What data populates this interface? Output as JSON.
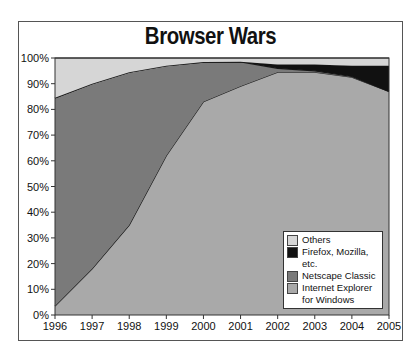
{
  "chart_data": {
    "type": "area",
    "stacked": true,
    "title": "Browser Wars",
    "xlabel": "",
    "ylabel": "",
    "x": [
      1996,
      1997,
      1998,
      1999,
      2000,
      2001,
      2002,
      2003,
      2004,
      2005
    ],
    "yticks": [
      "0%",
      "10%",
      "20%",
      "30%",
      "40%",
      "50%",
      "60%",
      "70%",
      "80%",
      "90%",
      "100%"
    ],
    "ylim": [
      0,
      100
    ],
    "grid": false,
    "legend_position": "lower right inside",
    "series": [
      {
        "name": "Internet Explorer for Windows",
        "color": "#a9a9a9",
        "values": [
          3.5,
          18,
          35,
          62,
          83,
          89,
          94.5,
          94.5,
          92.5,
          87
        ]
      },
      {
        "name": "Netscape Classic",
        "color": "#7a7a7a",
        "values": [
          81,
          72,
          59.5,
          35,
          15.4,
          9.5,
          1.5,
          0.5,
          0.3,
          0
        ]
      },
      {
        "name": "Firefox, Mozilla, etc.",
        "color": "#111111",
        "values": [
          0,
          0,
          0,
          0,
          0,
          0,
          1.5,
          2.5,
          4.2,
          10
        ]
      },
      {
        "name": "Others",
        "color": "#d6d6d6",
        "values": [
          15.5,
          10,
          5.5,
          3,
          1.6,
          1.5,
          2.5,
          2.5,
          3,
          3
        ]
      }
    ]
  },
  "legend": {
    "items": [
      {
        "label": "Others",
        "color": "#d6d6d6"
      },
      {
        "label": "Firefox, Mozilla, etc.",
        "color": "#111111"
      },
      {
        "label": "Netscape Classic",
        "color": "#7a7a7a"
      },
      {
        "label": "Internet Explorer for Windows",
        "color": "#a9a9a9"
      }
    ]
  }
}
